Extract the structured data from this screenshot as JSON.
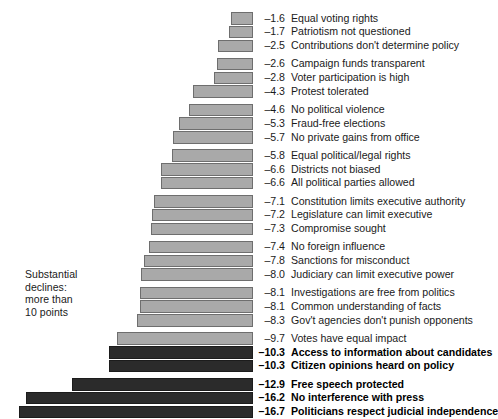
{
  "chart_data": {
    "type": "bar",
    "orientation": "horizontal",
    "title": "",
    "subtitle": "",
    "xlabel": "",
    "ylabel": "",
    "xlim": [
      -17.5,
      0
    ],
    "grid": false,
    "legend": false,
    "value_format": "one-decimal-negative",
    "severe_threshold": -10.0,
    "colors": {
      "bar_normal_fill": "#a9a9a9",
      "bar_normal_border": "#6e6e6e",
      "bar_severe_fill": "#2b2b2b",
      "bar_severe_border": "#1c1c1c",
      "text": "#1a1a1a",
      "text_severe": "#000000",
      "background": "#ffffff"
    },
    "annotation": {
      "lines": [
        "Substantial",
        "declines:",
        "more than",
        "10 points"
      ]
    },
    "groups": [
      {
        "items": [
          {
            "value": -1.6,
            "label": "Equal voting rights",
            "severe": false
          },
          {
            "value": -1.7,
            "label": "Patriotism not questioned",
            "severe": false
          },
          {
            "value": -2.5,
            "label": "Contributions don't determine policy",
            "severe": false
          }
        ]
      },
      {
        "items": [
          {
            "value": -2.6,
            "label": "Campaign funds transparent",
            "severe": false
          },
          {
            "value": -2.8,
            "label": "Voter participation is high",
            "severe": false
          },
          {
            "value": -4.3,
            "label": "Protest tolerated",
            "severe": false
          }
        ]
      },
      {
        "items": [
          {
            "value": -4.6,
            "label": "No political violence",
            "severe": false
          },
          {
            "value": -5.3,
            "label": "Fraud-free elections",
            "severe": false
          },
          {
            "value": -5.7,
            "label": "No private gains from office",
            "severe": false
          }
        ]
      },
      {
        "items": [
          {
            "value": -5.8,
            "label": "Equal political/legal rights",
            "severe": false
          },
          {
            "value": -6.6,
            "label": "Districts not biased",
            "severe": false
          },
          {
            "value": -6.6,
            "label": "All political parties allowed",
            "severe": false
          }
        ]
      },
      {
        "items": [
          {
            "value": -7.1,
            "label": "Constitution limits executive authority",
            "severe": false
          },
          {
            "value": -7.2,
            "label": "Legislature can limit executive",
            "severe": false
          },
          {
            "value": -7.3,
            "label": "Compromise sought",
            "severe": false
          }
        ]
      },
      {
        "items": [
          {
            "value": -7.4,
            "label": "No foreign influence",
            "severe": false
          },
          {
            "value": -7.8,
            "label": "Sanctions for misconduct",
            "severe": false
          },
          {
            "value": -8.0,
            "label": "Judiciary can limit executive power",
            "severe": false
          }
        ]
      },
      {
        "items": [
          {
            "value": -8.1,
            "label": "Investigations are free from politics",
            "severe": false
          },
          {
            "value": -8.1,
            "label": "Common understanding of facts",
            "severe": false
          },
          {
            "value": -8.3,
            "label": "Gov't agencies don't punish opponents",
            "severe": false
          }
        ]
      },
      {
        "items": [
          {
            "value": -9.7,
            "label": "Votes have equal impact",
            "severe": false
          },
          {
            "value": -10.3,
            "label": "Access to information about candidates",
            "severe": true
          },
          {
            "value": -10.3,
            "label": "Citizen opinions heard on policy",
            "severe": true
          }
        ]
      },
      {
        "items": [
          {
            "value": -12.9,
            "label": "Free speech protected",
            "severe": true
          },
          {
            "value": -16.2,
            "label": "No interference with press",
            "severe": true
          },
          {
            "value": -16.7,
            "label": "Politicians respect judicial independence",
            "severe": true
          }
        ]
      }
    ]
  }
}
